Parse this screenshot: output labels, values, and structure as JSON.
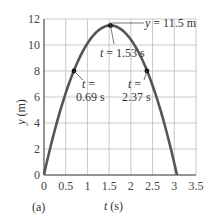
{
  "chart_data": {
    "type": "line",
    "title": "",
    "panel_label": "(a)",
    "xlabel": "t (s)",
    "ylabel": "y (m)",
    "xlim": [
      0,
      3.5
    ],
    "ylim": [
      0,
      12
    ],
    "xticks": [
      "0",
      "0.5",
      "1",
      "1.5",
      "2",
      "2.5",
      "3",
      "3.5"
    ],
    "yticks": [
      "0",
      "2",
      "4",
      "6",
      "8",
      "10",
      "12"
    ],
    "grid": true,
    "series": [
      {
        "name": "y(t)",
        "x": [
          0,
          0.25,
          0.5,
          0.69,
          1.0,
          1.25,
          1.53,
          1.75,
          2.0,
          2.37,
          2.6,
          2.85,
          3.06
        ],
        "values": [
          0,
          3.5,
          6.3,
          8.0,
          10.3,
          11.1,
          11.5,
          11.27,
          10.42,
          8.0,
          5.85,
          3.05,
          0
        ]
      }
    ],
    "annotations": [
      {
        "text": "y = 11.5 m",
        "x": 1.53,
        "y": 11.5
      },
      {
        "text": "t = 1.53 s",
        "x": 1.53,
        "y": 11.5
      },
      {
        "text": "t = 0.69 s",
        "x": 0.69,
        "y": 8
      },
      {
        "text": "t = 2.37 s",
        "x": 2.37,
        "y": 8
      }
    ]
  },
  "labels": {
    "ymax": "y = 11.5 m",
    "tpeak": "t = 1.53 s",
    "t1_a": "t =",
    "t1_b": "0.69 s",
    "t2_a": "t =",
    "t2_b": "2.37 s",
    "xlabel": "t (s)",
    "ylabel": "y (m)",
    "panel": "(a)"
  }
}
